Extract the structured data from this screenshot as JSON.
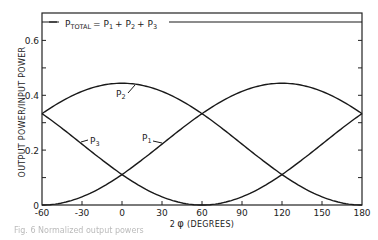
{
  "chart_data": {
    "type": "line",
    "title": "",
    "xlabel": "2φ (DEGREES)",
    "ylabel": "OUTPUT POWER/INPUT POWER",
    "xlim": [
      -60,
      180
    ],
    "ylim": [
      0,
      0.7
    ],
    "x_ticks": [
      -60,
      -30,
      0,
      30,
      60,
      90,
      120,
      150,
      180
    ],
    "x_tick_labels": [
      "-60",
      "-30",
      "0",
      "30",
      "60",
      "90",
      "120",
      "150",
      "180"
    ],
    "y_ticks": [
      0,
      0.1,
      0.2,
      0.3,
      0.4,
      0.5,
      0.6,
      0.7
    ],
    "y_tick_labels": [
      "0",
      "",
      "0.2",
      "",
      "0.4",
      "",
      "0.6",
      ""
    ],
    "grid": false,
    "legend": null,
    "x": [
      -60,
      -30,
      0,
      30,
      60,
      90,
      120,
      150,
      180
    ],
    "series": [
      {
        "name": "P1",
        "values": [
          0.0,
          0.03,
          0.111,
          0.222,
          0.333,
          0.415,
          0.444,
          0.415,
          0.333
        ]
      },
      {
        "name": "P2",
        "values": [
          0.333,
          0.415,
          0.444,
          0.415,
          0.333,
          0.222,
          0.111,
          0.03,
          0.0
        ]
      },
      {
        "name": "P3",
        "values": [
          0.333,
          0.222,
          0.111,
          0.03,
          0.0,
          0.03,
          0.111,
          0.222,
          0.333
        ]
      },
      {
        "name": "P_TOTAL",
        "values": [
          0.667,
          0.667,
          0.667,
          0.667,
          0.667,
          0.667,
          0.667,
          0.667,
          0.667
        ]
      }
    ],
    "annotations": [
      {
        "text": "P_TOTAL = P1 + P2 + P3",
        "x": -55,
        "y": 0.667
      },
      {
        "text": "P2",
        "x": 5,
        "y": 0.38
      },
      {
        "text": "P1",
        "x": 40,
        "y": 0.23
      },
      {
        "text": "P3",
        "x": -28,
        "y": 0.23
      }
    ]
  },
  "labels": {
    "ylabel": "OUTPUT POWER/INPUT POWER",
    "xlabel_prefix": "2",
    "xlabel_phi": "φ",
    "xlabel_suffix": "(DEGREES)",
    "ptotal_p": "P",
    "ptotal_sub": "TOTAL",
    "ptotal_eq": "= P",
    "p1_sub": "1",
    "plus1": "+ P",
    "p2_sub": "2",
    "plus2": "+ P",
    "p3_sub": "3",
    "p_letter": "P",
    "one": "1",
    "two": "2",
    "three": "3",
    "xt0": "-60",
    "xt1": "-30",
    "xt2": "0",
    "xt3": "30",
    "xt4": "60",
    "xt5": "90",
    "xt6": "120",
    "xt7": "150",
    "xt8": "180",
    "yt0": "0",
    "yt2": "0.2",
    "yt4": "0.4",
    "yt6": "0.6"
  },
  "caption": "Fig. 6  Normalized output powers"
}
